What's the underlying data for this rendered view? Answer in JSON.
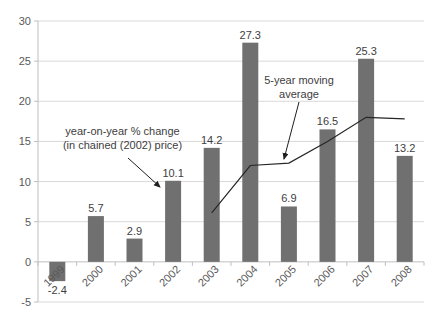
{
  "chart_data": {
    "type": "bar",
    "categories": [
      "1999",
      "2000",
      "2001",
      "2002",
      "2003",
      "2004",
      "2005",
      "2006",
      "2007",
      "2008"
    ],
    "series": [
      {
        "name": "year-on-year % change (in chained (2002) price)",
        "type": "bar",
        "values": [
          -2.4,
          5.7,
          2.9,
          10.1,
          14.2,
          27.3,
          6.9,
          16.5,
          25.3,
          13.2
        ]
      },
      {
        "name": "5-year moving average",
        "type": "line",
        "values": [
          null,
          null,
          null,
          null,
          6.1,
          12.0,
          12.3,
          15.0,
          18.0,
          17.8
        ]
      }
    ],
    "data_labels": [
      "-2.4",
      "5.7",
      "2.9",
      "10.1",
      "14.2",
      "27.3",
      "6.9",
      "16.5",
      "25.3",
      "13.2"
    ],
    "title": "",
    "xlabel": "",
    "ylabel": "",
    "ylim": [
      -5,
      30
    ],
    "yticks": [
      -5,
      0,
      5,
      10,
      15,
      20,
      25,
      30
    ],
    "grid": true,
    "legend_position": "none",
    "annotations": [
      {
        "line1": "year-on-year % change",
        "line2": "(in chained (2002) price)",
        "points_to": "2002 bar"
      },
      {
        "line1": "5-year moving",
        "line2": "average",
        "points_to": "moving average line"
      }
    ],
    "colors": {
      "bar": "#707070",
      "line": "#262626",
      "gridline": "#D9D9D9",
      "axis": "#BFBFBF",
      "axis_label": "#595959",
      "data_label": "#404040",
      "annotation": "#404040",
      "background": "#FFFFFF"
    }
  }
}
